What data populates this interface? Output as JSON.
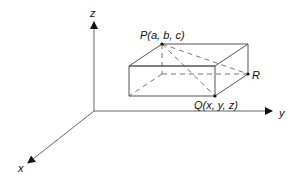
{
  "diagram": {
    "axes": {
      "x_label": "x",
      "y_label": "y",
      "z_label": "z"
    },
    "points": {
      "P": "P(a, b, c)",
      "Q": "Q(x, y, z)",
      "R": "R"
    },
    "colors": {
      "line": "#555555",
      "text": "#111111",
      "background": "#ffffff"
    }
  }
}
